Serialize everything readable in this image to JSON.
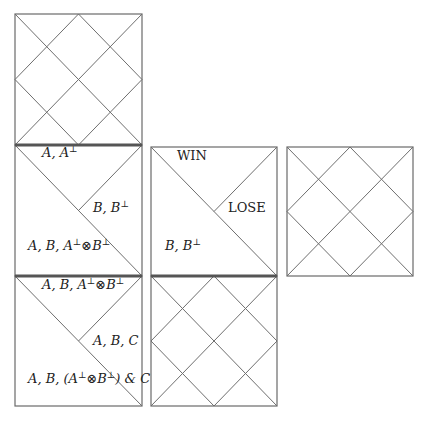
{
  "diagram": {
    "boards": [
      {
        "id": "board-top-left",
        "kind": "grid"
      },
      {
        "id": "board-mid-left",
        "kind": "split",
        "labels": {
          "top": "A, A⊥",
          "right": "B, B⊥",
          "left": "A, B, A⊥⊗B⊥"
        }
      },
      {
        "id": "board-bottom-left",
        "kind": "split",
        "labels": {
          "top": "A, B, A⊥⊗B⊥",
          "right": "A, B, C",
          "left": "A, B, (A⊥⊗B⊥) & C"
        }
      },
      {
        "id": "board-mid-center",
        "kind": "split",
        "labels": {
          "top": "WIN",
          "right": "LOSE",
          "left": "B, B⊥"
        }
      },
      {
        "id": "board-bottom-center",
        "kind": "grid"
      },
      {
        "id": "board-mid-right",
        "kind": "grid"
      }
    ]
  }
}
